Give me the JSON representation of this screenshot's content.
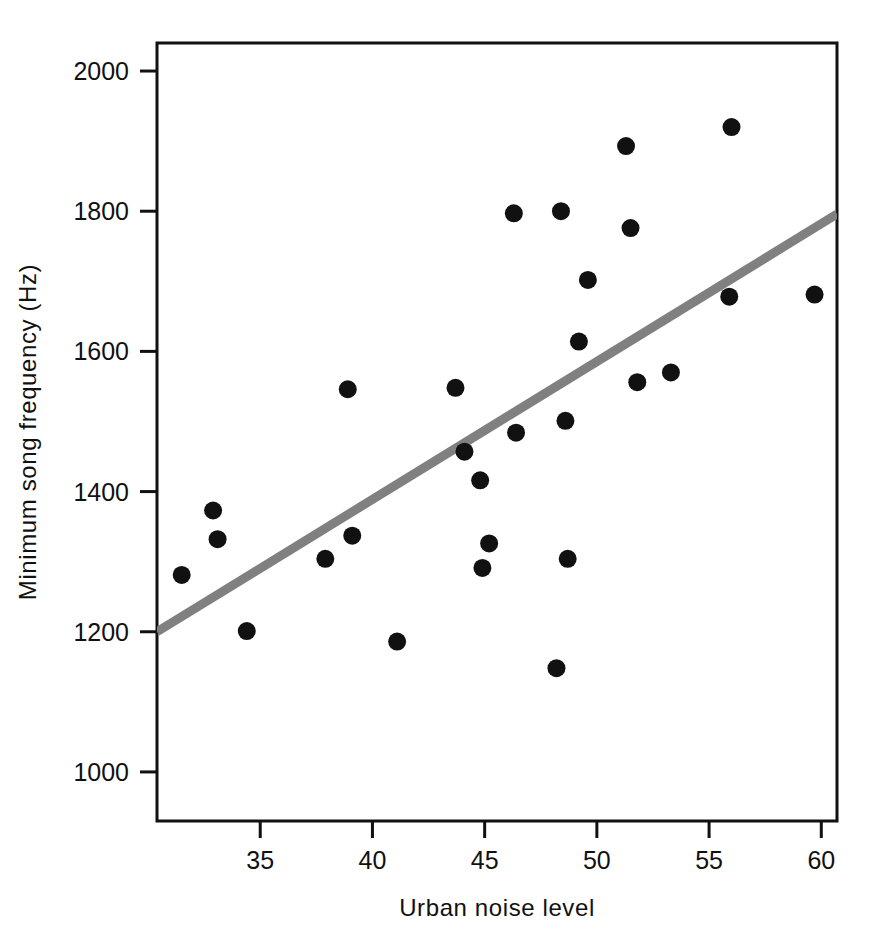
{
  "chart_data": {
    "type": "scatter",
    "title": "",
    "xlabel": "Urban  noise  level",
    "ylabel": "Minimum  song  frequency  (Hz)",
    "xlim": [
      30.4,
      60.7
    ],
    "ylim": [
      930,
      2040
    ],
    "xticks": [
      35,
      40,
      45,
      50,
      55,
      60
    ],
    "yticks": [
      1000,
      1200,
      1400,
      1600,
      1800,
      2000
    ],
    "xtick_labels": [
      "35",
      "40",
      "45",
      "50",
      "55",
      "60"
    ],
    "ytick_labels": [
      "1000",
      "1200",
      "1400",
      "1600",
      "1800",
      "2000"
    ],
    "grid": false,
    "legend": null,
    "marker": {
      "shape": "circle",
      "color": "#111111",
      "size_px": 9
    },
    "points": [
      {
        "x": 31.5,
        "y": 1281
      },
      {
        "x": 32.9,
        "y": 1373
      },
      {
        "x": 33.1,
        "y": 1332
      },
      {
        "x": 34.4,
        "y": 1201
      },
      {
        "x": 37.9,
        "y": 1304
      },
      {
        "x": 38.9,
        "y": 1546
      },
      {
        "x": 39.1,
        "y": 1337
      },
      {
        "x": 41.1,
        "y": 1186
      },
      {
        "x": 43.7,
        "y": 1548
      },
      {
        "x": 44.1,
        "y": 1457
      },
      {
        "x": 44.8,
        "y": 1416
      },
      {
        "x": 44.9,
        "y": 1291
      },
      {
        "x": 45.2,
        "y": 1326
      },
      {
        "x": 46.3,
        "y": 1797
      },
      {
        "x": 46.4,
        "y": 1484
      },
      {
        "x": 48.2,
        "y": 1148
      },
      {
        "x": 48.4,
        "y": 1800
      },
      {
        "x": 48.6,
        "y": 1501
      },
      {
        "x": 48.7,
        "y": 1304
      },
      {
        "x": 49.6,
        "y": 1702
      },
      {
        "x": 49.2,
        "y": 1614
      },
      {
        "x": 51.5,
        "y": 1776
      },
      {
        "x": 51.3,
        "y": 1893
      },
      {
        "x": 51.8,
        "y": 1556
      },
      {
        "x": 53.3,
        "y": 1570
      },
      {
        "x": 56.0,
        "y": 1920
      },
      {
        "x": 55.9,
        "y": 1678
      },
      {
        "x": 59.7,
        "y": 1681
      }
    ],
    "trendline": {
      "type": "linear-fit",
      "color": "#808080",
      "width_px": 9,
      "x_start": 30.4,
      "y_start": 1200,
      "x_end": 60.7,
      "y_end": 1796
    }
  },
  "axes": {
    "box_color": "#111111",
    "box_width_px": 3,
    "tick_color": "#111111"
  }
}
